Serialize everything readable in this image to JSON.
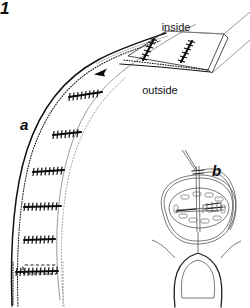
{
  "figure": {
    "kind": "surgical-technique-line-drawing",
    "background_color": "#ffffff",
    "ink_color": "#111111",
    "corner_mark": "1",
    "panels": [
      {
        "id": "a",
        "label": "a",
        "label_x": 20,
        "label_y": 130,
        "description": "curved tissue wall in cross-section with ladder of running mattress sutures and a rectangular flap"
      },
      {
        "id": "b",
        "label": "b",
        "label_x": 212,
        "label_y": 176,
        "description": "inset showing needle and thread passing through an oval cross-section above a U-shaped structure"
      }
    ],
    "annotations": [
      {
        "id": "inside",
        "text": "inside",
        "x": 176,
        "y": 31,
        "anchor": "middle"
      },
      {
        "id": "outside",
        "text": "outside",
        "x": 160,
        "y": 94,
        "anchor": "middle"
      }
    ],
    "flap": {
      "name": "rectangular flap",
      "corners": [
        [
          128,
          56
        ],
        [
          166,
          31
        ],
        [
          224,
          34
        ],
        [
          208,
          70
        ]
      ],
      "suture_count": 2
    },
    "suture_ladder": {
      "name": "running-suture-rungs",
      "count": 6,
      "rungs": [
        {
          "x1": 69,
          "y1": 97,
          "x2": 102,
          "y2": 92
        },
        {
          "x1": 53,
          "y1": 135,
          "x2": 81,
          "y2": 132
        },
        {
          "x1": 33,
          "y1": 172,
          "x2": 64,
          "y2": 170
        },
        {
          "x1": 24,
          "y1": 207,
          "x2": 61,
          "y2": 206
        },
        {
          "x1": 24,
          "y1": 240,
          "x2": 55,
          "y2": 239
        },
        {
          "x1": 16,
          "y1": 272,
          "x2": 58,
          "y2": 271
        }
      ]
    },
    "dashed_marker": {
      "name": "dashed-rectangle",
      "x": 23,
      "y": 265,
      "width": 34,
      "height": 9
    },
    "arrow": {
      "name": "direction-arrowhead",
      "x": 100,
      "y": 72
    }
  }
}
